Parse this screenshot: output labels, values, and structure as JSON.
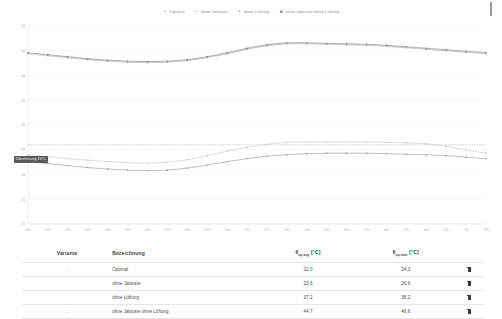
{
  "legend": {
    "items": [
      {
        "label": "Optimal",
        "marker": "dot-marker",
        "color": "#8c8c8c"
      },
      {
        "label": "ohne Jalousie",
        "marker": "dash-marker",
        "color": "#c0c0c0"
      },
      {
        "label": "ohne Lüftung",
        "marker": "dot-marker",
        "color": "#9a9a9a"
      },
      {
        "label": "ohne Jalousie ohne Lüftung",
        "marker": "square-marker",
        "color": "#6e6e6e"
      }
    ]
  },
  "chart_annotations": {
    "threshold_badge": "Überhitzung 26°C"
  },
  "table": {
    "headers": {
      "variante": "Variante",
      "bezeichnung": "Bezeichnung",
      "avg_prefix": "θ",
      "avg_sub": "op,avg",
      "avg_unit": " [°C]",
      "max_prefix": "θ",
      "max_sub": "op,max",
      "max_unit": " [°C]",
      "actions": ""
    },
    "rows": [
      {
        "marker": "+",
        "bezeichnung": "Optimal",
        "avg": "22,0",
        "max": "24,3",
        "delete": "delete-icon"
      },
      {
        "marker": "·",
        "bezeichnung": "ohne Jalousie",
        "avg": "23,6",
        "max": "26,6",
        "delete": "delete-icon"
      },
      {
        "marker": "",
        "bezeichnung": "ohne Lüftung",
        "avg": "37,2",
        "max": "38,2",
        "delete": "delete-icon"
      },
      {
        "marker": "+",
        "bezeichnung": "ohne Jalousie ohne Lüftung",
        "avg": "44,7",
        "max": "46,6",
        "delete": "delete-icon"
      }
    ]
  },
  "chart_data": {
    "type": "line",
    "title": "",
    "xlabel": "",
    "ylabel": "",
    "grid": true,
    "legend_position": "top-center",
    "xlim": [
      0,
      23
    ],
    "ylim": [
      10,
      50
    ],
    "yticks": [
      10,
      15,
      20,
      25,
      30,
      35,
      40,
      45,
      50
    ],
    "x": [
      0,
      1,
      2,
      3,
      4,
      5,
      6,
      7,
      8,
      9,
      10,
      11,
      12,
      13,
      14,
      15,
      16,
      17,
      18,
      19,
      20,
      21,
      22,
      23
    ],
    "xticklabels": [
      "00h",
      "01h",
      "02h",
      "03h",
      "04h",
      "05h",
      "06h",
      "07h",
      "08h",
      "09h",
      "10h",
      "11h",
      "12h",
      "13h",
      "14h",
      "15h",
      "16h",
      "17h",
      "18h",
      "19h",
      "20h",
      "21h",
      "22h",
      "23h"
    ],
    "threshold_line": {
      "value": 26,
      "label": "Überhitzung 26°C",
      "style": "dotted"
    },
    "series": [
      {
        "name": "ohne Jalousie ohne Lüftung",
        "color": "#6e6e6e",
        "values": [
          44.6,
          44.2,
          43.8,
          43.4,
          43.1,
          42.9,
          42.8,
          42.9,
          43.2,
          43.8,
          44.6,
          45.5,
          46.2,
          46.6,
          46.6,
          46.5,
          46.4,
          46.3,
          46.1,
          45.8,
          45.5,
          45.2,
          44.9,
          44.6
        ]
      },
      {
        "name": "ohne Lüftung",
        "color": "#9a9a9a",
        "values": [
          44.4,
          44.0,
          43.6,
          43.2,
          42.9,
          42.7,
          42.6,
          42.7,
          43.0,
          43.6,
          44.4,
          45.3,
          46.0,
          46.4,
          46.4,
          46.3,
          46.2,
          46.1,
          45.9,
          45.6,
          45.3,
          45.0,
          44.7,
          44.4
        ]
      },
      {
        "name": "ohne Jalousie",
        "color": "#c0c0c0",
        "values": [
          24.0,
          23.6,
          23.2,
          22.9,
          22.6,
          22.4,
          22.3,
          22.5,
          23.0,
          23.8,
          24.7,
          25.5,
          26.1,
          26.5,
          26.6,
          26.6,
          26.6,
          26.6,
          26.5,
          26.4,
          26.2,
          25.7,
          25.0,
          24.3
        ]
      },
      {
        "name": "Optimal",
        "color": "#8c8c8c",
        "values": [
          22.6,
          22.2,
          21.8,
          21.4,
          21.1,
          20.9,
          20.8,
          20.9,
          21.3,
          21.9,
          22.6,
          23.2,
          23.7,
          24.0,
          24.2,
          24.3,
          24.3,
          24.3,
          24.2,
          24.1,
          24.0,
          23.8,
          23.5,
          23.2
        ]
      }
    ]
  }
}
